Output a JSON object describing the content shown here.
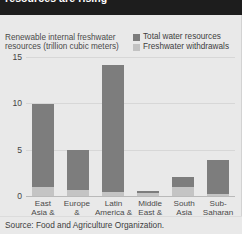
{
  "title": "resources are rising",
  "axis_label": "Renewable internal freshwater resources (trillion cubic meters)",
  "legend": [
    {
      "label": "Total water resources",
      "color": "#7d7d7d",
      "icon": "square-swatch-icon"
    },
    {
      "label": "Freshwater withdrawals",
      "color": "#c4c4c4",
      "icon": "square-swatch-icon"
    }
  ],
  "source": "Source: Food and Agriculture Organization.",
  "yticks": [
    "0",
    "5",
    "10",
    "15"
  ],
  "categories": [
    "East Asia & Pacific",
    "Europe & Central Asia",
    "Latin America & Caribbean",
    "Middle East & North Africa",
    "South Asia",
    "Sub-Saharan Africa"
  ],
  "chart_data": {
    "type": "bar",
    "title": "resources are rising",
    "xlabel": "",
    "ylabel": "Renewable internal freshwater resources (trillion cubic meters)",
    "ylim": [
      0,
      15
    ],
    "yticks": [
      0,
      5,
      10,
      15
    ],
    "grid": true,
    "legend_position": "top-right",
    "categories": [
      "East Asia & Pacific",
      "Europe & Central Asia",
      "Latin America & Caribbean",
      "Middle East & North Africa",
      "South Asia",
      "Sub-Saharan Africa"
    ],
    "series": [
      {
        "name": "Total water resources",
        "color": "#7d7d7d",
        "values": [
          9.9,
          5.0,
          14.1,
          0.5,
          2.0,
          3.9
        ]
      },
      {
        "name": "Freshwater withdrawals",
        "color": "#c4c4c4",
        "values": [
          1.0,
          0.6,
          0.4,
          0.3,
          1.0,
          0.2
        ]
      }
    ]
  }
}
